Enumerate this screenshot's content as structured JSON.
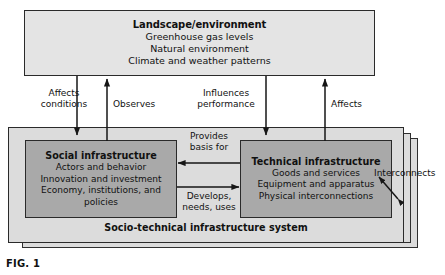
{
  "figure": {
    "caption": "FIG. 1",
    "system_label": "Socio-technical infrastructure system"
  },
  "boxes": {
    "landscape": {
      "title": "Landscape/environment",
      "lines": [
        "Greenhouse gas levels",
        "Natural environment",
        "Climate and weather patterns"
      ]
    },
    "social": {
      "title": "Social infrastructure",
      "lines": [
        "Actors and behavior",
        "Innovation and investment",
        "Economy, institutions, and",
        "policies"
      ]
    },
    "technical": {
      "title": "Technical infrastructure",
      "lines": [
        "Goods and services",
        "Equipment and apparatus",
        "Physical interconnections"
      ]
    }
  },
  "arrow_labels": {
    "affects_conditions": "Affects\nconditions",
    "affects_conditions_l1": "Affects",
    "affects_conditions_l2": "conditions",
    "observes": "Observes",
    "influences_performance_l1": "Influences",
    "influences_performance_l2": "performance",
    "affects": "Affects",
    "provides_basis_l1": "Provides",
    "provides_basis_l2": "basis for",
    "develops_l1": "Develops,",
    "develops_l2": "needs, uses",
    "interconnects": "Interconnects"
  },
  "colors": {
    "landscape_fill": "#e4e4e4",
    "panel_fill": "#dcdcdc",
    "inner_fill": "#a9a9a9",
    "stroke": "#2a2a2a",
    "page_background": "#ffffff"
  }
}
